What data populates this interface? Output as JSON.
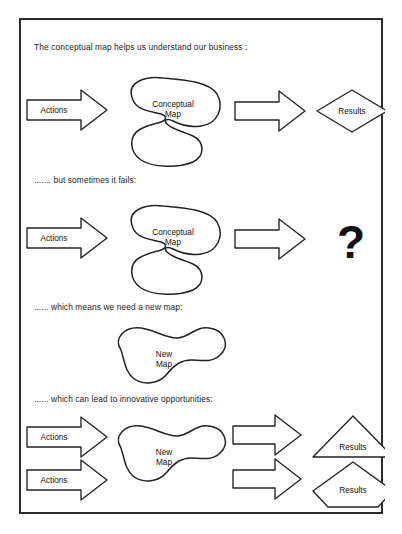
{
  "diagram": {
    "title_line": "The conceptual map helps us understand our business :",
    "sections": [
      {
        "id": "section-1",
        "caption": "The conceptual map helps us understand our business :",
        "input_label": "Actions",
        "map_label_line1": "Conceptual",
        "map_label_line2": "Map",
        "output_label": "Results",
        "output_shape": "diamond"
      },
      {
        "id": "section-2",
        "caption": "....... but sometimes it fails:",
        "input_label": "Actions",
        "map_label_line1": "Conceptual",
        "map_label_line2": "Map",
        "output_label": "?",
        "output_shape": "question-mark"
      },
      {
        "id": "section-3",
        "caption": "...... which means we need a new map:",
        "map_label_line1": "New",
        "map_label_line2": "Map"
      },
      {
        "id": "section-4",
        "caption": "...... which can lead to innovative opportunities:",
        "input_label_top": "Actions",
        "input_label_bottom": "Actions",
        "map_label_line1": "New",
        "map_label_line2": "Map",
        "output_label_top": "Results",
        "output_label_bottom": "Results",
        "output_shape_top": "triangle",
        "output_shape_bottom": "pentagon"
      }
    ]
  },
  "colors": {
    "border": "#2b2b2b",
    "stroke": "#222222",
    "fill": "#ffffff",
    "text": "#1a1a1a"
  }
}
